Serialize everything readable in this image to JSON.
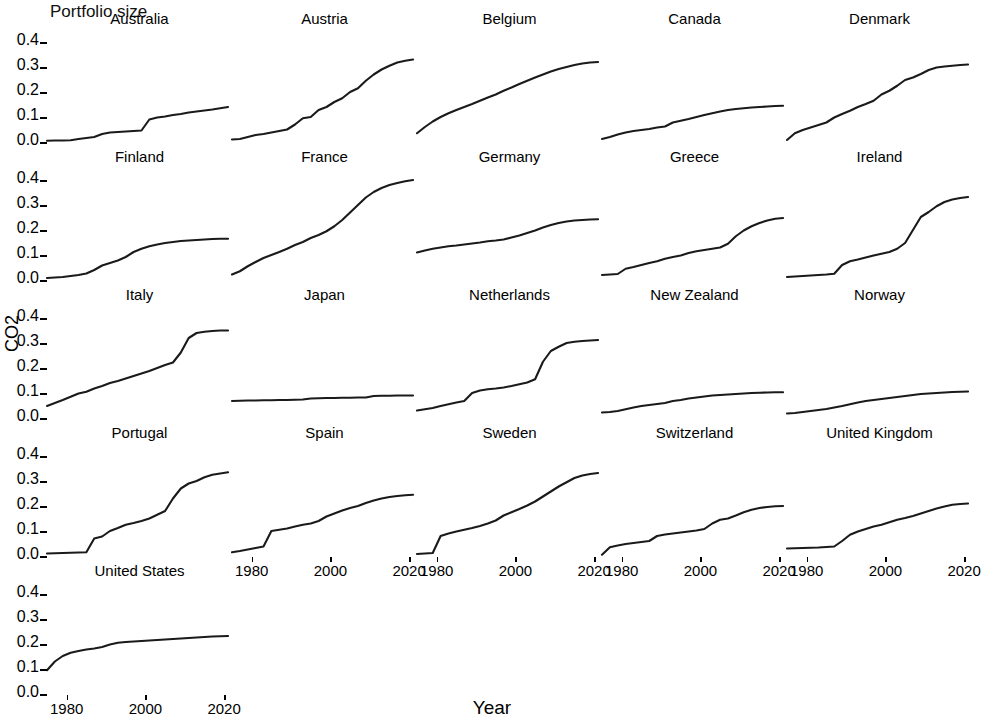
{
  "chart_data": {
    "type": "line",
    "title": "Portfolio size",
    "xlabel": "Year",
    "ylabel": "CO2",
    "facet_layout": {
      "rows": 5,
      "cols": 5,
      "shared_y": true,
      "shared_x": true,
      "grid": false
    },
    "xlim": [
      1975,
      2022
    ],
    "ylim": [
      0.0,
      0.44
    ],
    "xticks": [
      1980,
      2000,
      2020
    ],
    "xtick_labels": [
      "1980",
      "2000",
      "2020"
    ],
    "yticks": [
      0.0,
      0.1,
      0.2,
      0.3,
      0.4
    ],
    "ytick_labels": [
      "0.0",
      "0.1",
      "0.2",
      "0.3",
      "0.4"
    ],
    "x": [
      1975,
      1977,
      1979,
      1981,
      1983,
      1985,
      1987,
      1989,
      1991,
      1993,
      1995,
      1997,
      1999,
      2001,
      2003,
      2005,
      2007,
      2009,
      2011,
      2013,
      2015,
      2017,
      2019,
      2021
    ],
    "series": [
      {
        "name": "Australia",
        "values": [
          0.005,
          0.006,
          0.006,
          0.007,
          0.012,
          0.016,
          0.02,
          0.032,
          0.038,
          0.04,
          0.042,
          0.044,
          0.046,
          0.09,
          0.098,
          0.102,
          0.108,
          0.112,
          0.118,
          0.122,
          0.126,
          0.13,
          0.135,
          0.14
        ]
      },
      {
        "name": "Austria",
        "values": [
          0.01,
          0.012,
          0.02,
          0.028,
          0.032,
          0.038,
          0.044,
          0.05,
          0.07,
          0.095,
          0.1,
          0.128,
          0.14,
          0.16,
          0.175,
          0.2,
          0.215,
          0.245,
          0.27,
          0.29,
          0.305,
          0.318,
          0.325,
          0.33
        ]
      },
      {
        "name": "Belgium",
        "values": [
          0.035,
          0.06,
          0.082,
          0.1,
          0.115,
          0.128,
          0.14,
          0.152,
          0.165,
          0.178,
          0.19,
          0.205,
          0.218,
          0.232,
          0.245,
          0.258,
          0.27,
          0.282,
          0.292,
          0.3,
          0.308,
          0.314,
          0.318,
          0.32
        ]
      },
      {
        "name": "Canada",
        "values": [
          0.012,
          0.02,
          0.03,
          0.038,
          0.044,
          0.048,
          0.052,
          0.058,
          0.062,
          0.078,
          0.085,
          0.092,
          0.1,
          0.108,
          0.115,
          0.122,
          0.128,
          0.132,
          0.135,
          0.138,
          0.14,
          0.142,
          0.144,
          0.145
        ]
      },
      {
        "name": "Denmark",
        "values": [
          0.008,
          0.035,
          0.048,
          0.058,
          0.068,
          0.078,
          0.098,
          0.112,
          0.125,
          0.14,
          0.152,
          0.165,
          0.19,
          0.205,
          0.225,
          0.248,
          0.258,
          0.272,
          0.288,
          0.298,
          0.302,
          0.305,
          0.308,
          0.31
        ]
      },
      {
        "name": "Finland",
        "values": [
          0.008,
          0.01,
          0.012,
          0.016,
          0.02,
          0.026,
          0.04,
          0.058,
          0.068,
          0.078,
          0.092,
          0.112,
          0.125,
          0.135,
          0.142,
          0.148,
          0.152,
          0.156,
          0.158,
          0.16,
          0.162,
          0.164,
          0.165,
          0.165
        ]
      },
      {
        "name": "France",
        "values": [
          0.022,
          0.035,
          0.055,
          0.072,
          0.088,
          0.1,
          0.112,
          0.125,
          0.14,
          0.152,
          0.168,
          0.18,
          0.195,
          0.215,
          0.24,
          0.27,
          0.3,
          0.33,
          0.352,
          0.368,
          0.38,
          0.388,
          0.395,
          0.4
        ]
      },
      {
        "name": "Germany",
        "values": [
          0.11,
          0.118,
          0.125,
          0.13,
          0.135,
          0.138,
          0.142,
          0.146,
          0.15,
          0.155,
          0.158,
          0.162,
          0.17,
          0.178,
          0.188,
          0.198,
          0.21,
          0.22,
          0.228,
          0.234,
          0.238,
          0.24,
          0.242,
          0.243
        ]
      },
      {
        "name": "Greece",
        "values": [
          0.02,
          0.022,
          0.024,
          0.045,
          0.052,
          0.06,
          0.068,
          0.075,
          0.085,
          0.092,
          0.098,
          0.108,
          0.115,
          0.12,
          0.125,
          0.13,
          0.145,
          0.175,
          0.198,
          0.215,
          0.228,
          0.238,
          0.245,
          0.248
        ]
      },
      {
        "name": "Ireland",
        "values": [
          0.012,
          0.014,
          0.016,
          0.018,
          0.02,
          0.022,
          0.025,
          0.06,
          0.075,
          0.082,
          0.09,
          0.098,
          0.105,
          0.112,
          0.125,
          0.148,
          0.2,
          0.252,
          0.272,
          0.295,
          0.312,
          0.322,
          0.328,
          0.332
        ]
      },
      {
        "name": "Italy",
        "values": [
          0.048,
          0.06,
          0.072,
          0.085,
          0.098,
          0.105,
          0.118,
          0.128,
          0.14,
          0.148,
          0.158,
          0.168,
          0.178,
          0.188,
          0.2,
          0.212,
          0.222,
          0.262,
          0.32,
          0.34,
          0.345,
          0.348,
          0.35,
          0.35
        ]
      },
      {
        "name": "Japan",
        "values": [
          0.068,
          0.069,
          0.07,
          0.07,
          0.071,
          0.071,
          0.072,
          0.072,
          0.073,
          0.074,
          0.078,
          0.079,
          0.08,
          0.08,
          0.081,
          0.081,
          0.082,
          0.082,
          0.088,
          0.089,
          0.089,
          0.09,
          0.09,
          0.09
        ]
      },
      {
        "name": "Netherlands",
        "values": [
          0.03,
          0.035,
          0.04,
          0.048,
          0.055,
          0.062,
          0.068,
          0.1,
          0.11,
          0.115,
          0.118,
          0.122,
          0.128,
          0.135,
          0.142,
          0.155,
          0.225,
          0.268,
          0.285,
          0.3,
          0.305,
          0.308,
          0.31,
          0.312
        ]
      },
      {
        "name": "New Zealand",
        "values": [
          0.022,
          0.024,
          0.028,
          0.035,
          0.042,
          0.048,
          0.052,
          0.056,
          0.06,
          0.068,
          0.072,
          0.078,
          0.082,
          0.086,
          0.09,
          0.092,
          0.094,
          0.096,
          0.098,
          0.1,
          0.101,
          0.102,
          0.103,
          0.103
        ]
      },
      {
        "name": "Norway",
        "values": [
          0.018,
          0.02,
          0.024,
          0.028,
          0.032,
          0.036,
          0.042,
          0.048,
          0.055,
          0.062,
          0.068,
          0.072,
          0.076,
          0.08,
          0.084,
          0.088,
          0.092,
          0.096,
          0.098,
          0.1,
          0.102,
          0.104,
          0.105,
          0.106
        ]
      },
      {
        "name": "Portugal",
        "values": [
          0.01,
          0.011,
          0.012,
          0.013,
          0.014,
          0.015,
          0.07,
          0.078,
          0.1,
          0.112,
          0.125,
          0.132,
          0.14,
          0.15,
          0.165,
          0.18,
          0.23,
          0.27,
          0.29,
          0.3,
          0.315,
          0.325,
          0.33,
          0.335
        ]
      },
      {
        "name": "Spain",
        "values": [
          0.015,
          0.02,
          0.026,
          0.032,
          0.038,
          0.1,
          0.105,
          0.11,
          0.118,
          0.125,
          0.13,
          0.14,
          0.158,
          0.17,
          0.182,
          0.192,
          0.2,
          0.212,
          0.222,
          0.23,
          0.236,
          0.24,
          0.243,
          0.245
        ]
      },
      {
        "name": "Sweden",
        "values": [
          0.008,
          0.01,
          0.012,
          0.08,
          0.09,
          0.098,
          0.105,
          0.112,
          0.12,
          0.13,
          0.142,
          0.162,
          0.175,
          0.188,
          0.202,
          0.218,
          0.238,
          0.258,
          0.278,
          0.295,
          0.312,
          0.322,
          0.328,
          0.332
        ]
      },
      {
        "name": "Switzerland",
        "values": [
          0.005,
          0.035,
          0.042,
          0.048,
          0.052,
          0.056,
          0.06,
          0.08,
          0.086,
          0.09,
          0.094,
          0.098,
          0.102,
          0.108,
          0.13,
          0.145,
          0.15,
          0.162,
          0.175,
          0.185,
          0.192,
          0.196,
          0.199,
          0.2
        ]
      },
      {
        "name": "United Kingdom",
        "values": [
          0.03,
          0.031,
          0.032,
          0.033,
          0.034,
          0.036,
          0.038,
          0.06,
          0.085,
          0.098,
          0.108,
          0.118,
          0.125,
          0.135,
          0.145,
          0.152,
          0.16,
          0.17,
          0.18,
          0.19,
          0.198,
          0.205,
          0.208,
          0.21
        ]
      },
      {
        "name": "United States",
        "values": [
          0.095,
          0.13,
          0.152,
          0.165,
          0.172,
          0.178,
          0.182,
          0.188,
          0.198,
          0.205,
          0.208,
          0.21,
          0.212,
          0.214,
          0.216,
          0.218,
          0.22,
          0.222,
          0.224,
          0.226,
          0.228,
          0.23,
          0.231,
          0.232
        ]
      }
    ]
  },
  "panels": [
    {
      "label": "Australia"
    },
    {
      "label": "Austria"
    },
    {
      "label": "Belgium"
    },
    {
      "label": "Canada"
    },
    {
      "label": "Denmark"
    },
    {
      "label": "Finland"
    },
    {
      "label": "France"
    },
    {
      "label": "Germany"
    },
    {
      "label": "Greece"
    },
    {
      "label": "Ireland"
    },
    {
      "label": "Italy"
    },
    {
      "label": "Japan"
    },
    {
      "label": "Netherlands"
    },
    {
      "label": "New Zealand"
    },
    {
      "label": "Norway"
    },
    {
      "label": "Portugal"
    },
    {
      "label": "Spain"
    },
    {
      "label": "Sweden"
    },
    {
      "label": "Switzerland"
    },
    {
      "label": "United Kingdom"
    },
    {
      "label": "United States"
    }
  ]
}
